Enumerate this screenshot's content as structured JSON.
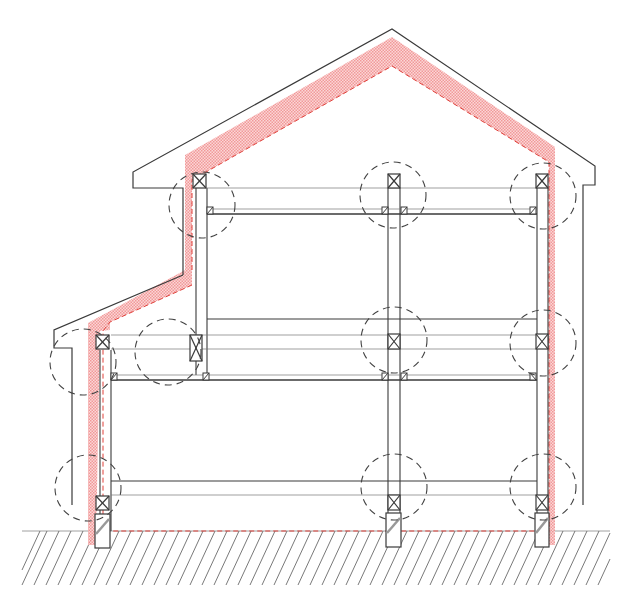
{
  "diagram": {
    "type": "architectural-section",
    "colors": {
      "line": "#3a3a3a",
      "thin_line": "#7a7a7a",
      "insulation": "#f4a7a7",
      "insulation_dash": "#e0403a",
      "detail_circle": "#444444",
      "ground_hatch": "#6a6a6a",
      "background": "#ffffff"
    },
    "elements": {
      "roof_peak": {
        "x": 392,
        "y": 29
      },
      "ground_level_y": 531,
      "columns": [
        {
          "name": "column-lower-left",
          "x": 100,
          "w": 11
        },
        {
          "name": "column-upper-left",
          "x": 196,
          "w": 11
        },
        {
          "name": "column-middle",
          "x": 388,
          "w": 12
        },
        {
          "name": "column-right",
          "x": 537,
          "w": 11
        }
      ],
      "detail_circles": [
        {
          "name": "detail-upper-left",
          "cx": 202,
          "cy": 205,
          "r": 33
        },
        {
          "name": "detail-upper-middle",
          "cx": 393,
          "cy": 195,
          "r": 33
        },
        {
          "name": "detail-upper-right",
          "cx": 543,
          "cy": 196,
          "r": 33
        },
        {
          "name": "detail-mid-left-eave",
          "cx": 83,
          "cy": 362,
          "r": 33
        },
        {
          "name": "detail-mid-left-column",
          "cx": 168,
          "cy": 352,
          "r": 33
        },
        {
          "name": "detail-mid-middle",
          "cx": 394,
          "cy": 340,
          "r": 33
        },
        {
          "name": "detail-mid-right",
          "cx": 543,
          "cy": 343,
          "r": 33
        },
        {
          "name": "detail-base-left",
          "cx": 88,
          "cy": 488,
          "r": 33
        },
        {
          "name": "detail-base-middle",
          "cx": 394,
          "cy": 487,
          "r": 33
        },
        {
          "name": "detail-base-right",
          "cx": 543,
          "cy": 487,
          "r": 33
        }
      ]
    }
  }
}
